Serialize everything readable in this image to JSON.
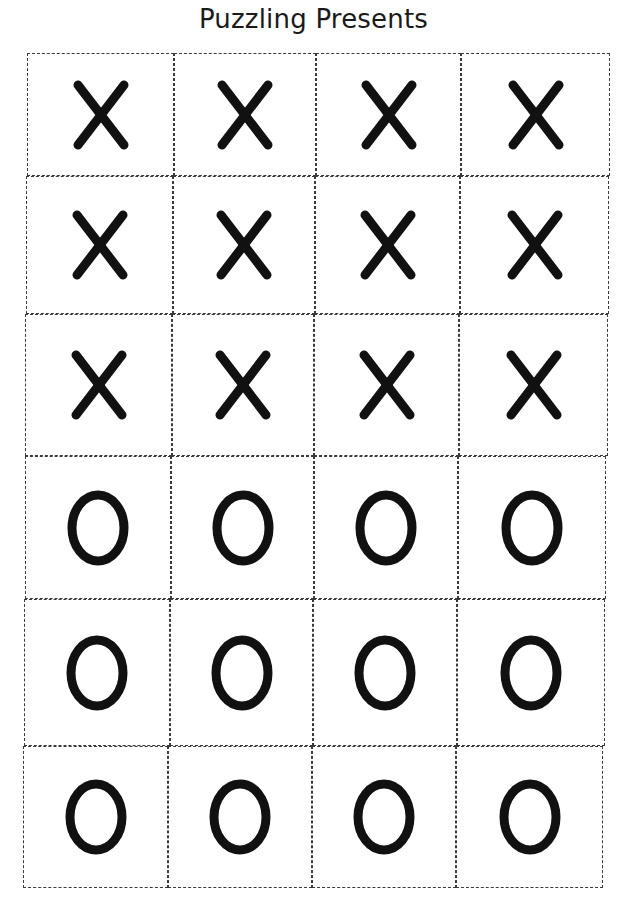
{
  "page": {
    "title": "Puzzling Presents"
  },
  "grid": {
    "columns": 4,
    "rows": 6,
    "border_style": "dashed",
    "border_color": "#3a3a3a",
    "glyph_color": "#111111",
    "cells": [
      [
        "X",
        "X",
        "X",
        "X"
      ],
      [
        "X",
        "X",
        "X",
        "X"
      ],
      [
        "X",
        "X",
        "X",
        "X"
      ],
      [
        "O",
        "O",
        "O",
        "O"
      ],
      [
        "O",
        "O",
        "O",
        "O"
      ],
      [
        "O",
        "O",
        "O",
        "O"
      ]
    ]
  }
}
